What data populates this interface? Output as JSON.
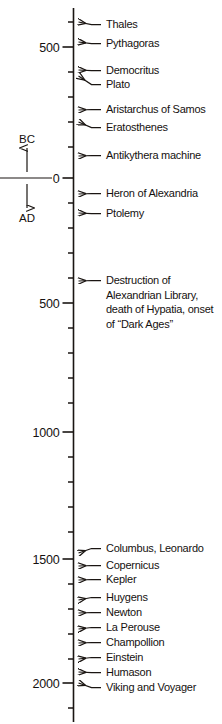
{
  "chart_data": {
    "type": "timeline",
    "title": "",
    "orientation": "vertical",
    "axis": {
      "label_top": "BC",
      "label_bottom": "AD",
      "zero_year": 0,
      "range_top_year": -650,
      "range_bottom_year": 2180,
      "grid": false,
      "minor_tick_interval_years": 100,
      "major_tick_interval_years": 500
    },
    "tick_labels": [
      {
        "text": "500",
        "year": -500,
        "y": 47
      },
      {
        "text": "0",
        "year": 0,
        "y": 178
      },
      {
        "text": "500",
        "year": 500,
        "y": 303
      },
      {
        "text": "1000",
        "year": 1000,
        "y": 432
      },
      {
        "text": "1500",
        "year": 1500,
        "y": 559
      },
      {
        "text": "2000",
        "year": 2000,
        "y": 683
      }
    ],
    "minor_ticks_y": [
      22,
      72,
      97,
      122,
      147,
      203,
      228,
      253,
      278,
      328,
      353,
      378,
      403,
      457,
      482,
      507,
      532,
      584,
      609,
      634,
      659,
      708
    ],
    "events": [
      {
        "label": "Thales",
        "tick_y": 22,
        "text_y": 28,
        "lines": [
          "Thales"
        ]
      },
      {
        "label": "Pythagoras",
        "tick_y": 42,
        "text_y": 47,
        "lines": [
          "Pythagoras"
        ]
      },
      {
        "label": "Democritus",
        "tick_y": 70,
        "text_y": 74,
        "lines": [
          "Democritus"
        ]
      },
      {
        "label": "Plato",
        "tick_y": 76,
        "text_y": 88,
        "lines": [
          "Plato"
        ]
      },
      {
        "label": "Aristarchus of Samos",
        "tick_y": 110,
        "text_y": 113,
        "lines": [
          "Aristarchus of Samos"
        ]
      },
      {
        "label": "Eratosthenes",
        "tick_y": 122,
        "text_y": 131,
        "lines": [
          "Eratosthenes"
        ]
      },
      {
        "label": "Antikythera machine",
        "tick_y": 156,
        "text_y": 159,
        "lines": [
          "Antikythera machine"
        ]
      },
      {
        "label": "Heron of Alexandria",
        "tick_y": 194,
        "text_y": 197,
        "lines": [
          "Heron of Alexandria"
        ]
      },
      {
        "label": "Ptolemy",
        "tick_y": 213,
        "text_y": 217,
        "lines": [
          "Ptolemy"
        ]
      },
      {
        "label": "Destruction of Alexandrian Library, death of Hypatia, onset of “Dark Ages”",
        "tick_y": 281,
        "text_y": 284,
        "lines": [
          "Destruction of",
          "Alexandrian Library,",
          "death of Hypatia, onset",
          "of “Dark Ages”"
        ]
      },
      {
        "label": "Columbus, Leonardo",
        "tick_y": 553,
        "text_y": 552,
        "lines": [
          "Columbus, Leonardo"
        ]
      },
      {
        "label": "Copernicus",
        "tick_y": 566,
        "text_y": 569,
        "lines": [
          "Copernicus"
        ]
      },
      {
        "label": "Kepler",
        "tick_y": 580,
        "text_y": 583,
        "lines": [
          "Kepler"
        ]
      },
      {
        "label": "Huygens",
        "tick_y": 600,
        "text_y": 601,
        "lines": [
          "Huygens"
        ]
      },
      {
        "label": "Newton",
        "tick_y": 613,
        "text_y": 616,
        "lines": [
          "Newton"
        ]
      },
      {
        "label": "La Perouse",
        "tick_y": 629,
        "text_y": 631,
        "lines": [
          "La Perouse"
        ]
      },
      {
        "label": "Champollion",
        "tick_y": 643,
        "text_y": 646,
        "lines": [
          "Champollion"
        ]
      },
      {
        "label": "Einstein",
        "tick_y": 659,
        "text_y": 661,
        "lines": [
          "Einstein"
        ]
      },
      {
        "label": "Humason",
        "tick_y": 672,
        "text_y": 676,
        "lines": [
          "Humason"
        ]
      },
      {
        "label": "Viking and Voyager",
        "tick_y": 683,
        "text_y": 691,
        "lines": [
          "Viking and Voyager"
        ]
      }
    ],
    "colors": {
      "ink": "#15110f",
      "background": "#ffffff"
    }
  }
}
